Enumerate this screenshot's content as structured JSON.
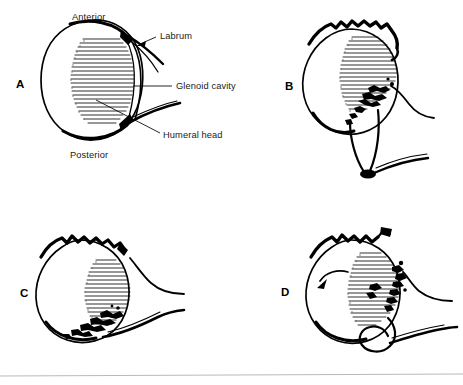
{
  "figure": {
    "width": 463,
    "height": 385,
    "background_color": "#ffffff",
    "ink_color": "#000000",
    "rule_color": "#b9b9bd"
  },
  "panels": [
    {
      "id": "A",
      "letter": "A",
      "letter_x": 16,
      "letter_y": 88,
      "description": "Normal glenoid labrum and glenoid cavity with humeral head, intact smooth contour"
    },
    {
      "id": "B",
      "letter": "B",
      "letter_x": 285,
      "letter_y": 90,
      "description": "Irregular superior contour with fragmented labrum at the inferior glenoid rim"
    },
    {
      "id": "C",
      "letter": "C",
      "letter_x": 20,
      "letter_y": 297,
      "description": "Detached labral fragments along the inferior-anterior glenoid margin"
    },
    {
      "id": "D",
      "letter": "D",
      "letter_x": 281,
      "letter_y": 296,
      "description": "Humeral head rotation indicated by curved arrow with extensive labral disruption"
    }
  ],
  "annotations": [
    {
      "id": "anterior",
      "text": "Anterior",
      "x": 72,
      "y": 20,
      "anchor": "start",
      "has_leader": false
    },
    {
      "id": "labrum",
      "text": "Labrum",
      "x": 160,
      "y": 39,
      "anchor": "start",
      "has_leader": true
    },
    {
      "id": "glenoid-cavity",
      "text": "Glenoid cavity",
      "x": 176,
      "y": 89,
      "anchor": "start",
      "has_leader": true
    },
    {
      "id": "humeral-head",
      "text": "Humeral head",
      "x": 163,
      "y": 138,
      "anchor": "start",
      "has_leader": true
    },
    {
      "id": "posterior",
      "text": "Posterior",
      "x": 70,
      "y": 158,
      "anchor": "start",
      "has_leader": false
    }
  ]
}
